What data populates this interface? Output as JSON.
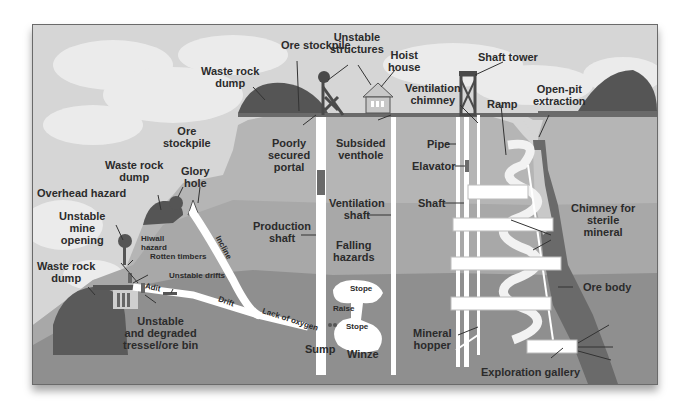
{
  "labels": {
    "ore_stockpile_top": "Ore stockpile",
    "unstable_structures": "Unstable\nstructures",
    "hoist_house": "Hoist\nhouse",
    "shaft_tower": "Shaft tower",
    "waste_rock_dump_top": "Waste rock\ndump",
    "ventilation_chimney": "Ventilation\nchimney",
    "ramp": "Ramp",
    "open_pit_extraction": "Open-pit\nextraction",
    "poorly_secured_portal": "Poorly\nsecured\nportal",
    "subsided_venthole": "Subsided\nventhole",
    "pipe": "Pipe",
    "elevator": "Elavator",
    "ore_stockpile_left": "Ore\nstockpile",
    "waste_rock_dump_mid": "Waste rock\ndump",
    "glory_hole": "Glory\nhole",
    "overhead_hazard": "Overhead hazard",
    "shaft": "Shaft",
    "ventilation_shaft": "Ventilation\nshaft",
    "production_shaft": "Production\nshaft",
    "chimney_sterile": "Chimney for\nsterile\nmineral",
    "unstable_mine_opening": "Unstable\nmine\nopening",
    "hiwall_hazard": "Hiwall\nhazard",
    "rotten_timbers": "Rotten timbers",
    "falling_hazards": "Falling\nhazards",
    "incline": "Incline",
    "waste_rock_dump_left": "Waste rock\ndump",
    "unstable_drifts": "Unstable drifts",
    "adit": "Adit",
    "drift": "Drift",
    "lack_of_oxygen": "Lack of oxygen",
    "stope_top": "Stope",
    "raise": "Raise",
    "stope_bottom": "Stope",
    "ore_body": "Ore body",
    "unstable_tressel": "Unstable\nand degraded\ntressel/ore bin",
    "sump": "Sump",
    "winze": "Winze",
    "mineral_hopper": "Mineral\nhopper",
    "exploration_gallery": "Exploration gallery"
  },
  "colors": {
    "sky": "#d8d8d8",
    "cloud": "#efefef",
    "upper_rock": "#b8b8b8",
    "mid_rock": "#a9a9a9",
    "lower_rock": "#8e8e8e",
    "dump": "#5a5a5a",
    "ore_body": "#6e6e6e",
    "tunnel": "#ffffff",
    "text": "#2b2b2b"
  }
}
